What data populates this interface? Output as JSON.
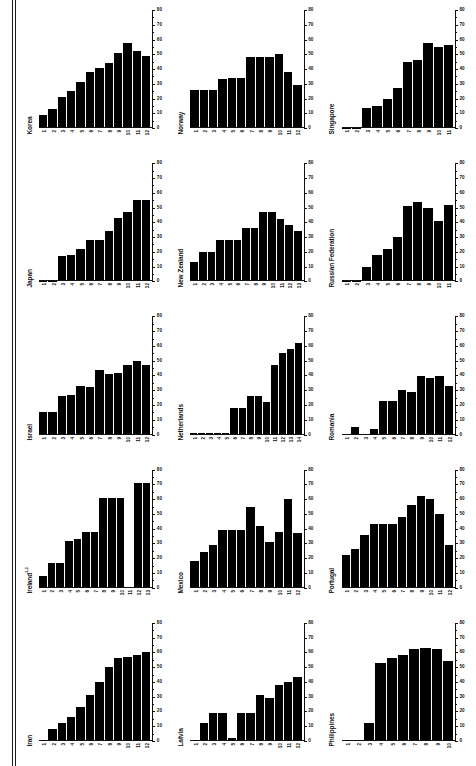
{
  "figure": {
    "type": "small-multiples-bar-panels",
    "panel_count": 15,
    "columns": 3,
    "rows": 5,
    "bar_color": "#000000",
    "axis_color": "#111111",
    "background": "#ffffff"
  },
  "axis": {
    "y_ticks": [
      "0",
      "10",
      "20",
      "30",
      "40",
      "50",
      "60",
      "70",
      "80"
    ],
    "y_min": 0,
    "y_max": 80,
    "y_position": "right",
    "minor_ticks_per_interval": 1,
    "grid": false
  },
  "chart_data": [
    {
      "type": "bar",
      "title": "Korea",
      "xlabel": "",
      "ylabel": "",
      "ylim": [
        0,
        80
      ],
      "categories": [
        "1",
        "2",
        "3",
        "4",
        "5",
        "6",
        "7",
        "8",
        "9",
        "10",
        "11",
        "12"
      ],
      "values": [
        9,
        13,
        21,
        25,
        31,
        38,
        41,
        44,
        51,
        58,
        52,
        49
      ]
    },
    {
      "type": "bar",
      "title": "Norway",
      "xlabel": "",
      "ylabel": "",
      "ylim": [
        0,
        80
      ],
      "categories": [
        "1",
        "2",
        "3",
        "4",
        "5",
        "6",
        "7",
        "8",
        "9",
        "10",
        "11",
        "12"
      ],
      "values": [
        26,
        26,
        26,
        33,
        34,
        34,
        48,
        48,
        48,
        50,
        38,
        29
      ]
    },
    {
      "type": "bar",
      "title": "Singapore",
      "xlabel": "",
      "ylabel": "",
      "ylim": [
        0,
        80
      ],
      "categories": [
        "1",
        "2",
        "3",
        "4",
        "5",
        "6",
        "7",
        "8",
        "9",
        "10",
        "11"
      ],
      "values": [
        0,
        0,
        14,
        15,
        20,
        27,
        45,
        46,
        58,
        55,
        56
      ]
    },
    {
      "type": "bar",
      "title": "Japan",
      "xlabel": "",
      "ylabel": "",
      "ylim": [
        0,
        80
      ],
      "categories": [
        "1",
        "2",
        "3",
        "4",
        "5",
        "6",
        "7",
        "8",
        "9",
        "10",
        "11",
        "12"
      ],
      "values": [
        0,
        0,
        17,
        18,
        22,
        28,
        28,
        34,
        43,
        47,
        55,
        55
      ]
    },
    {
      "type": "bar",
      "title": "New Zealand",
      "xlabel": "",
      "ylabel": "",
      "ylim": [
        0,
        80
      ],
      "categories": [
        "1",
        "2",
        "3",
        "4",
        "5",
        "6",
        "7",
        "8",
        "9",
        "10",
        "11",
        "12",
        "13"
      ],
      "values": [
        13,
        20,
        20,
        28,
        28,
        28,
        36,
        36,
        47,
        47,
        42,
        38,
        34
      ]
    },
    {
      "type": "bar",
      "title": "Russian Federation",
      "xlabel": "",
      "ylabel": "",
      "ylim": [
        0,
        80
      ],
      "categories": [
        "1",
        "2",
        "3",
        "4",
        "5",
        "6",
        "7",
        "8",
        "9",
        "10"
      ],
      "values": [
        0,
        0,
        10,
        18,
        22,
        30,
        51,
        54,
        50,
        41,
        52
      ]
    },
    {
      "type": "bar",
      "title": "Israel",
      "xlabel": "",
      "ylabel": "",
      "ylim": [
        0,
        80
      ],
      "categories": [
        "1",
        "2",
        "3",
        "4",
        "5",
        "6",
        "7",
        "8",
        "9",
        "10",
        "11",
        "12"
      ],
      "values": [
        15,
        15,
        26,
        27,
        33,
        32,
        44,
        41,
        42,
        47,
        50,
        47
      ]
    },
    {
      "type": "bar",
      "title": "Netherlands",
      "xlabel": "",
      "ylabel": "",
      "ylim": [
        0,
        80
      ],
      "categories": [
        "1",
        "2",
        "3",
        "4",
        "5",
        "6",
        "7",
        "8",
        "9",
        "10",
        "11",
        "12",
        "13"
      ],
      "values": [
        1,
        1,
        1,
        1,
        1,
        18,
        18,
        26,
        26,
        22,
        47,
        55,
        58,
        62
      ]
    },
    {
      "type": "bar",
      "title": "Romania",
      "xlabel": "",
      "ylabel": "",
      "ylim": [
        0,
        80
      ],
      "categories": [
        "1",
        "2",
        "3",
        "4",
        "5",
        "6",
        "7",
        "8",
        "9",
        "10",
        "11",
        "12"
      ],
      "values": [
        0,
        5,
        0,
        4,
        23,
        23,
        30,
        29,
        40,
        38,
        40,
        33
      ]
    },
    {
      "type": "bar",
      "title": "Ireland",
      "title_superscript": "1,2",
      "xlabel": "",
      "ylabel": "",
      "ylim": [
        0,
        80
      ],
      "categories": [
        "1",
        "2",
        "3",
        "4",
        "5",
        "6",
        "7",
        "8",
        "9",
        "10",
        "11",
        "12"
      ],
      "values": [
        8,
        17,
        17,
        32,
        33,
        38,
        38,
        61,
        61,
        61,
        0,
        71,
        71
      ]
    },
    {
      "type": "bar",
      "title": "Mexico",
      "xlabel": "",
      "ylabel": "",
      "ylim": [
        0,
        80
      ],
      "categories": [
        "1",
        "2",
        "3",
        "4",
        "5",
        "6",
        "7",
        "8",
        "9",
        "10",
        "11",
        "12"
      ],
      "values": [
        18,
        24,
        29,
        39,
        39,
        39,
        55,
        42,
        31,
        38,
        60,
        37
      ]
    },
    {
      "type": "bar",
      "title": "Portugal",
      "xlabel": "",
      "ylabel": "",
      "ylim": [
        0,
        80
      ],
      "categories": [
        "1",
        "2",
        "3",
        "4",
        "5",
        "6",
        "7",
        "8",
        "9",
        "10",
        "11",
        "12"
      ],
      "values": [
        22,
        26,
        36,
        43,
        43,
        43,
        48,
        56,
        62,
        60,
        50,
        29
      ]
    },
    {
      "type": "bar",
      "title": "Iran",
      "xlabel": "",
      "ylabel": "",
      "ylim": [
        0,
        80
      ],
      "categories": [
        "1",
        "2",
        "3",
        "4",
        "5",
        "6",
        "7",
        "8",
        "9",
        "10",
        "11",
        "12"
      ],
      "values": [
        0,
        8,
        12,
        16,
        23,
        31,
        40,
        50,
        56,
        57,
        58,
        60
      ]
    },
    {
      "type": "bar",
      "title": "Latvia",
      "xlabel": "",
      "ylabel": "",
      "ylim": [
        0,
        80
      ],
      "categories": [
        "1",
        "2",
        "3",
        "4",
        "5",
        "6",
        "7",
        "8",
        "9",
        "10",
        "11",
        "12"
      ],
      "values": [
        1,
        12,
        19,
        19,
        2,
        19,
        19,
        31,
        29,
        38,
        40,
        43
      ]
    },
    {
      "type": "bar",
      "title": "Philippines",
      "xlabel": "",
      "ylabel": "",
      "ylim": [
        0,
        80
      ],
      "categories": [
        "1",
        "2",
        "3",
        "4",
        "5",
        "6",
        "7",
        "8",
        "9",
        "10"
      ],
      "values": [
        0,
        0,
        12,
        53,
        56,
        58,
        62,
        63,
        62,
        54
      ]
    }
  ]
}
